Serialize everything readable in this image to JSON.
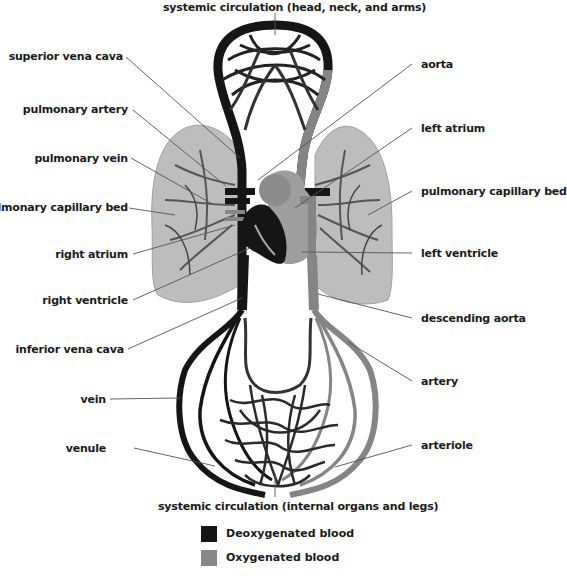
{
  "title_top": "systemic circulation (head, neck, and arms)",
  "title_bottom": "systemic circulation (internal organs and legs)",
  "labels_left": [
    {
      "id": "superior-vena-cava",
      "text": "superior vena cava"
    },
    {
      "id": "pulmonary-artery",
      "text": "pulmonary artery"
    },
    {
      "id": "pulmonary-vein",
      "text": "pulmonary vein"
    },
    {
      "id": "pulmonary-capillary-bed-left",
      "text": "pulmonary capillary bed"
    },
    {
      "id": "right-atrium",
      "text": "right atrium"
    },
    {
      "id": "right-ventricle",
      "text": "right ventricle"
    },
    {
      "id": "inferior-vena-cava",
      "text": "inferior vena cava"
    },
    {
      "id": "vein",
      "text": "vein"
    },
    {
      "id": "venule",
      "text": "venule"
    }
  ],
  "labels_right": [
    {
      "id": "aorta",
      "text": "aorta"
    },
    {
      "id": "left-atrium",
      "text": "left atrium"
    },
    {
      "id": "pulmonary-capillary-bed-right",
      "text": "pulmonary capillary bed"
    },
    {
      "id": "left-ventricle",
      "text": "left ventricle"
    },
    {
      "id": "descending-aorta",
      "text": "descending aorta"
    },
    {
      "id": "artery",
      "text": "artery"
    },
    {
      "id": "arteriole",
      "text": "arteriole"
    }
  ],
  "legend": [
    {
      "label": "Deoxygenated blood",
      "color": "#151515"
    },
    {
      "label": "Oxygenated blood",
      "color": "#888888"
    }
  ],
  "colors": {
    "deoxygenated": "#151515",
    "oxygenated": "#858585",
    "lung": "#b9b9b9",
    "lung_edge": "#9a9a9a",
    "leader_line": "#555555"
  }
}
